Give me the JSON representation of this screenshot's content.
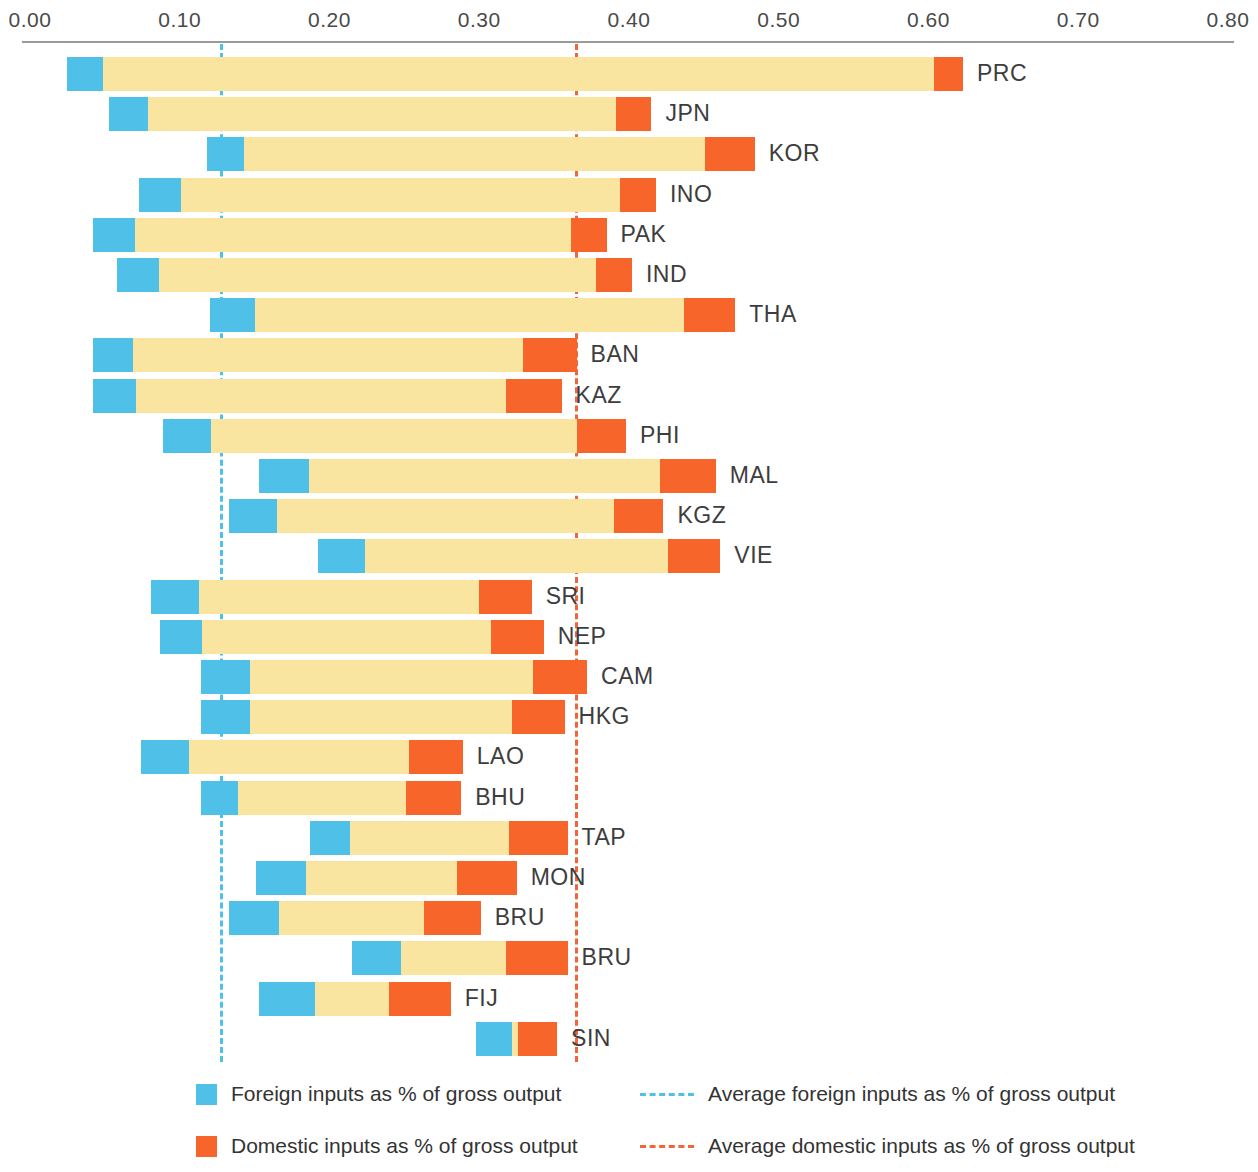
{
  "chart_data": {
    "type": "bar",
    "title": "",
    "subtitle": "",
    "xlabel": "",
    "ylabel": "",
    "xlim": [
      0.0,
      0.8
    ],
    "grid": false,
    "orientation": "horizontal",
    "stacked_offset": true,
    "axis": {
      "ticks": [
        {
          "value": 0.0,
          "label": "0.00"
        },
        {
          "value": 0.1,
          "label": "0.10"
        },
        {
          "value": 0.2,
          "label": "0.20"
        },
        {
          "value": 0.3,
          "label": "0.30"
        },
        {
          "value": 0.4,
          "label": "0.40"
        },
        {
          "value": 0.5,
          "label": "0.50"
        },
        {
          "value": 0.6,
          "label": "0.60"
        },
        {
          "value": 0.7,
          "label": "0.70"
        },
        {
          "value": 0.8,
          "label": "0.80"
        }
      ]
    },
    "reference_lines": [
      {
        "name": "average-foreign",
        "value": 0.127,
        "color": "#4FC1E9",
        "style": "dashed",
        "label": "Average foreign inputs as % of gross output"
      },
      {
        "name": "average-domestic",
        "value": 0.364,
        "color": "#F0663A",
        "style": "dashed",
        "label": "Average domestic inputs as % of gross output"
      }
    ],
    "colors": {
      "foreign": "#4FC1E9",
      "middle": "#FAE5A0",
      "domestic": "#F8652B",
      "axis": "#9A9A9A",
      "text": "#3D3D3D"
    },
    "categories": [
      "PRC",
      "JPN",
      "KOR",
      "INO",
      "PAK",
      "IND",
      "THA",
      "BAN",
      "KAZ",
      "PHI",
      "MAL",
      "KGZ",
      "VIE",
      "SRI",
      "NEP",
      "CAM",
      "HKG",
      "LAO",
      "BHU",
      "TAP",
      "MON",
      "BRU",
      "BRU",
      "FIJ",
      "SIN"
    ],
    "bars": [
      {
        "label": "PRC",
        "start": 0.025,
        "foreign_end": 0.049,
        "domestic_start": 0.604,
        "end": 0.623
      },
      {
        "label": "JPN",
        "start": 0.053,
        "foreign_end": 0.079,
        "domestic_start": 0.391,
        "end": 0.415
      },
      {
        "label": "KOR",
        "start": 0.118,
        "foreign_end": 0.143,
        "domestic_start": 0.451,
        "end": 0.484
      },
      {
        "label": "INO",
        "start": 0.073,
        "foreign_end": 0.101,
        "domestic_start": 0.394,
        "end": 0.418
      },
      {
        "label": "PAK",
        "start": 0.042,
        "foreign_end": 0.07,
        "domestic_start": 0.361,
        "end": 0.385
      },
      {
        "label": "IND",
        "start": 0.058,
        "foreign_end": 0.086,
        "domestic_start": 0.378,
        "end": 0.402
      },
      {
        "label": "THA",
        "start": 0.12,
        "foreign_end": 0.15,
        "domestic_start": 0.437,
        "end": 0.471
      },
      {
        "label": "BAN",
        "start": 0.042,
        "foreign_end": 0.069,
        "domestic_start": 0.329,
        "end": 0.365
      },
      {
        "label": "KAZ",
        "start": 0.042,
        "foreign_end": 0.071,
        "domestic_start": 0.318,
        "end": 0.355
      },
      {
        "label": "PHI",
        "start": 0.089,
        "foreign_end": 0.121,
        "domestic_start": 0.365,
        "end": 0.398
      },
      {
        "label": "MAL",
        "start": 0.153,
        "foreign_end": 0.186,
        "domestic_start": 0.421,
        "end": 0.458
      },
      {
        "label": "KGZ",
        "start": 0.133,
        "foreign_end": 0.165,
        "domestic_start": 0.39,
        "end": 0.423
      },
      {
        "label": "VIE",
        "start": 0.192,
        "foreign_end": 0.224,
        "domestic_start": 0.426,
        "end": 0.461
      },
      {
        "label": "SRI",
        "start": 0.081,
        "foreign_end": 0.113,
        "domestic_start": 0.3,
        "end": 0.335
      },
      {
        "label": "NEP",
        "start": 0.087,
        "foreign_end": 0.115,
        "domestic_start": 0.308,
        "end": 0.343
      },
      {
        "label": "CAM",
        "start": 0.114,
        "foreign_end": 0.147,
        "domestic_start": 0.336,
        "end": 0.372
      },
      {
        "label": "HKG",
        "start": 0.114,
        "foreign_end": 0.147,
        "domestic_start": 0.322,
        "end": 0.357
      },
      {
        "label": "LAO",
        "start": 0.074,
        "foreign_end": 0.106,
        "domestic_start": 0.253,
        "end": 0.289
      },
      {
        "label": "BHU",
        "start": 0.114,
        "foreign_end": 0.139,
        "domestic_start": 0.251,
        "end": 0.288
      },
      {
        "label": "TAP",
        "start": 0.187,
        "foreign_end": 0.214,
        "domestic_start": 0.32,
        "end": 0.359
      },
      {
        "label": "MON",
        "start": 0.151,
        "foreign_end": 0.184,
        "domestic_start": 0.285,
        "end": 0.325
      },
      {
        "label": "BRU",
        "start": 0.133,
        "foreign_end": 0.166,
        "domestic_start": 0.263,
        "end": 0.301
      },
      {
        "label": "BRU",
        "start": 0.215,
        "foreign_end": 0.248,
        "domestic_start": 0.318,
        "end": 0.359
      },
      {
        "label": "FIJ",
        "start": 0.153,
        "foreign_end": 0.19,
        "domestic_start": 0.24,
        "end": 0.281
      },
      {
        "label": "SIN",
        "start": 0.298,
        "foreign_end": 0.322,
        "domestic_start": 0.326,
        "end": 0.352
      }
    ],
    "legend": {
      "position": "bottom",
      "entries": [
        {
          "name": "foreign-inputs",
          "marker": "square",
          "color": "#4FC1E9",
          "label": "Foreign inputs as % of gross output"
        },
        {
          "name": "domestic-inputs",
          "marker": "square",
          "color": "#F8652B",
          "label": "Domestic inputs as % of gross output"
        },
        {
          "name": "average-foreign-inputs",
          "marker": "dashed-line",
          "color": "#4FC1E9",
          "label": "Average foreign inputs as % of gross output"
        },
        {
          "name": "average-domestic-inputs",
          "marker": "dashed-line",
          "color": "#F0663A",
          "label": "Average domestic inputs as % of gross output"
        }
      ]
    }
  }
}
